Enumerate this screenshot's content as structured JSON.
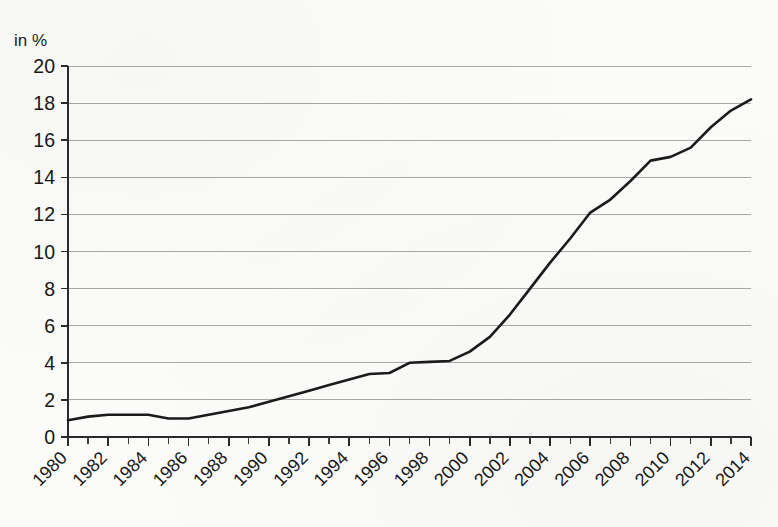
{
  "chart_data": {
    "type": "line",
    "title": "",
    "subtitle": "",
    "xlabel": "",
    "ylabel": "in %",
    "y_unit_label": "in %",
    "grid": true,
    "legend": null,
    "legend_position": "none",
    "xlim": [
      1980,
      2014
    ],
    "ylim": [
      0,
      20
    ],
    "y_tick_step": 2,
    "x_tick_step": 2,
    "x_minor_tick_step": 1,
    "ytick_labels": [
      "0",
      "2",
      "4",
      "6",
      "8",
      "10",
      "12",
      "14",
      "16",
      "18",
      "20"
    ],
    "ytick_values": [
      0,
      2,
      4,
      6,
      8,
      10,
      12,
      14,
      16,
      18,
      20
    ],
    "xtick_labels": [
      "1980",
      "1982",
      "1984",
      "1986",
      "1988",
      "1990",
      "1992",
      "1994",
      "1996",
      "1998",
      "2000",
      "2002",
      "2004",
      "2006",
      "2008",
      "2010",
      "2012",
      "2014"
    ],
    "xtick_values": [
      1980,
      1982,
      1984,
      1986,
      1988,
      1990,
      1992,
      1994,
      1996,
      1998,
      2000,
      2002,
      2004,
      2006,
      2008,
      2010,
      2012,
      2014
    ],
    "xtick_label_rotation_deg": -45,
    "series": [
      {
        "name": "share",
        "color": "#1b1b1b",
        "x": [
          1980,
          1981,
          1982,
          1983,
          1984,
          1985,
          1986,
          1987,
          1988,
          1989,
          1990,
          1991,
          1992,
          1993,
          1994,
          1995,
          1996,
          1997,
          1998,
          1999,
          2000,
          2001,
          2002,
          2003,
          2004,
          2005,
          2006,
          2007,
          2008,
          2009,
          2010,
          2011,
          2012,
          2013,
          2014
        ],
        "values": [
          0.9,
          1.1,
          1.2,
          1.2,
          1.2,
          1.0,
          1.0,
          1.2,
          1.4,
          1.6,
          1.9,
          2.2,
          2.5,
          2.8,
          3.1,
          3.4,
          3.45,
          4.0,
          4.05,
          4.1,
          4.6,
          5.4,
          6.6,
          8.0,
          9.4,
          10.7,
          12.1,
          12.8,
          13.8,
          14.9,
          15.1,
          15.6,
          16.7,
          17.6,
          18.2
        ]
      }
    ],
    "colors": {
      "line": "#1b1b1b",
      "grid": "#a9a9a9",
      "axis": "#2b2b2b",
      "background": "#fbfbf9",
      "text": "#171717"
    }
  }
}
